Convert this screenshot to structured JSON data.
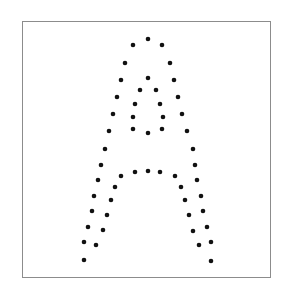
{
  "chart_data": {
    "type": "scatter",
    "title": "",
    "xlabel": "",
    "ylabel": "",
    "axes_visible": false,
    "grid": false,
    "legend": null,
    "frame": {
      "x": 22,
      "y": 21,
      "width": 249,
      "height": 257,
      "color": "#8c8c8c"
    },
    "marker": {
      "color": "#111111",
      "radius": 2.3
    },
    "coordinate_note": "pixel coordinates, origin top-left of image",
    "series": [
      {
        "name": "letter-A",
        "points": [
          [
            148,
            39
          ],
          [
            133,
            45
          ],
          [
            162,
            45
          ],
          [
            125,
            63
          ],
          [
            170,
            63
          ],
          [
            121,
            80
          ],
          [
            148,
            78
          ],
          [
            174,
            80
          ],
          [
            140,
            90
          ],
          [
            156,
            90
          ],
          [
            117,
            97
          ],
          [
            178,
            97
          ],
          [
            135,
            104
          ],
          [
            160,
            104
          ],
          [
            113,
            114
          ],
          [
            182,
            114
          ],
          [
            133,
            117
          ],
          [
            163,
            117
          ],
          [
            109,
            131
          ],
          [
            133,
            129
          ],
          [
            148,
            133
          ],
          [
            162,
            129
          ],
          [
            187,
            131
          ],
          [
            105,
            149
          ],
          [
            193,
            149
          ],
          [
            101,
            165
          ],
          [
            195,
            165
          ],
          [
            135,
            172
          ],
          [
            148,
            171
          ],
          [
            160,
            172
          ],
          [
            121,
            176
          ],
          [
            175,
            176
          ],
          [
            98,
            180
          ],
          [
            197,
            180
          ],
          [
            115,
            187
          ],
          [
            181,
            187
          ],
          [
            94,
            196
          ],
          [
            201,
            196
          ],
          [
            111,
            200
          ],
          [
            185,
            200
          ],
          [
            92,
            211
          ],
          [
            203,
            211
          ],
          [
            107,
            215
          ],
          [
            189,
            215
          ],
          [
            88,
            227
          ],
          [
            207,
            227
          ],
          [
            103,
            230
          ],
          [
            193,
            231
          ],
          [
            84,
            242
          ],
          [
            211,
            242
          ],
          [
            96,
            245
          ],
          [
            199,
            245
          ],
          [
            84,
            260
          ],
          [
            211,
            261
          ]
        ]
      }
    ]
  }
}
